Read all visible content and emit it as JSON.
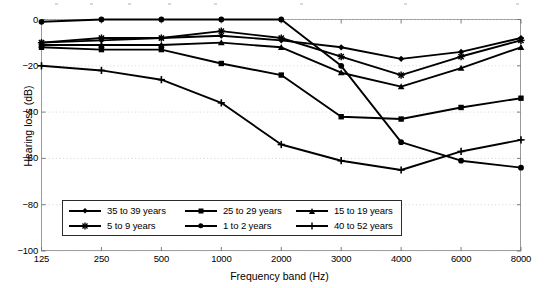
{
  "chart_data": {
    "type": "line",
    "title": "",
    "xlabel": "Frequency band (Hz)",
    "ylabel": "Hearing loss (dB)",
    "categories": [
      "125",
      "250",
      "500",
      "1000",
      "2000",
      "3000",
      "4000",
      "6000",
      "8000"
    ],
    "x_tick_labels": [
      "125",
      "250",
      "500",
      "1000",
      "2000",
      "3000",
      "4000",
      "6000",
      "8000"
    ],
    "y_tick_labels": [
      "0",
      "-20",
      "-40",
      "-60",
      "-80",
      "-100"
    ],
    "y_ticks": [
      0,
      -20,
      -40,
      -60,
      -80,
      -100
    ],
    "ylim": [
      -100,
      0
    ],
    "grid": "horizontal-dotted",
    "legend_position": "lower-left-inside",
    "series": [
      {
        "name": "35 to 39 years",
        "marker": "diamond",
        "values": [
          -10,
          -9,
          -8,
          -7,
          -9,
          -12,
          -17,
          -14,
          -8
        ]
      },
      {
        "name": "25 to 29 years",
        "marker": "square",
        "values": [
          -12,
          -13,
          -13,
          -19,
          -24,
          -42,
          -43,
          -38,
          -34
        ]
      },
      {
        "name": "15 to 19 years",
        "marker": "triangle",
        "values": [
          -11,
          -11,
          -11,
          -10,
          -12,
          -23,
          -29,
          -21,
          -12
        ]
      },
      {
        "name": "5 to 9 years",
        "marker": "star",
        "values": [
          -10,
          -8,
          -8,
          -5,
          -8,
          -16,
          -24,
          -16,
          -9
        ]
      },
      {
        "name": "1 to 2 years",
        "marker": "circle",
        "values": [
          -1,
          0,
          0,
          0,
          0,
          -20,
          -53,
          -61,
          -64
        ]
      },
      {
        "name": "40 to 52 years",
        "marker": "plus",
        "values": [
          -20,
          -22,
          -26,
          -36,
          -54,
          -61,
          -65,
          -57,
          -52
        ]
      }
    ]
  },
  "axes": {
    "ylabel": "Hearing loss (dB)",
    "xlabel": "Frequency band (Hz)"
  },
  "legend": {
    "rows": [
      [
        {
          "label": "35 to 39 years",
          "marker": "diamond"
        },
        {
          "label": "25 to 29 years",
          "marker": "square"
        },
        {
          "label": "15 to 19 years",
          "marker": "triangle"
        }
      ],
      [
        {
          "label": "5 to 9 years",
          "marker": "star"
        },
        {
          "label": "1 to 2 years",
          "marker": "circle"
        },
        {
          "label": "40 to 52 years",
          "marker": "plus"
        }
      ]
    ]
  }
}
